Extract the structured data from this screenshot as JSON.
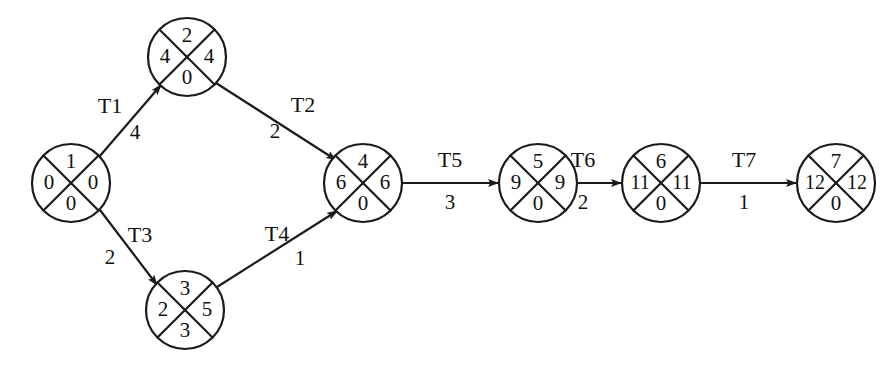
{
  "diagram": {
    "type": "pert-cpm-network",
    "title": "",
    "node_radius": 39,
    "node_cell_layout": {
      "top": "event-number",
      "left": "earliest-time",
      "right": "latest-time",
      "bottom": "slack"
    },
    "nodes": [
      {
        "id": "node-1",
        "cx": 71,
        "cy": 183,
        "top": "1",
        "left": "0",
        "right": "0",
        "bottom": "0"
      },
      {
        "id": "node-2",
        "cx": 187,
        "cy": 57,
        "top": "2",
        "left": "4",
        "right": "4",
        "bottom": "0"
      },
      {
        "id": "node-3",
        "cx": 185,
        "cy": 310,
        "top": "3",
        "left": "2",
        "right": "5",
        "bottom": "3"
      },
      {
        "id": "node-4",
        "cx": 363,
        "cy": 183,
        "top": "4",
        "left": "6",
        "right": "6",
        "bottom": "0"
      },
      {
        "id": "node-5",
        "cx": 538,
        "cy": 183,
        "top": "5",
        "left": "9",
        "right": "9",
        "bottom": "0"
      },
      {
        "id": "node-6",
        "cx": 661,
        "cy": 183,
        "top": "6",
        "left": "11",
        "right": "11",
        "bottom": "0"
      },
      {
        "id": "node-7",
        "cx": 836,
        "cy": 183,
        "top": "7",
        "left": "12",
        "right": "12",
        "bottom": "0"
      }
    ],
    "edges": [
      {
        "id": "edge-t1",
        "label": "T1",
        "duration": "4",
        "from": "node-1",
        "to": "node-2",
        "x1": 99,
        "y1": 157,
        "x2": 161,
        "y2": 85,
        "label_x": 110,
        "label_y": 108,
        "dur_x": 135,
        "dur_y": 134
      },
      {
        "id": "edge-t2",
        "label": "T2",
        "duration": "2",
        "from": "node-2",
        "to": "node-4",
        "x1": 216,
        "y1": 83,
        "x2": 336,
        "y2": 160,
        "label_x": 303,
        "label_y": 107,
        "dur_x": 275,
        "dur_y": 133
      },
      {
        "id": "edge-t3",
        "label": "T3",
        "duration": "2",
        "from": "node-1",
        "to": "node-3",
        "x1": 100,
        "y1": 210,
        "x2": 157,
        "y2": 285,
        "label_x": 140,
        "label_y": 237,
        "dur_x": 110,
        "dur_y": 259
      },
      {
        "id": "edge-t4",
        "label": "T4",
        "duration": "1",
        "from": "node-3",
        "to": "node-4",
        "x1": 217,
        "y1": 287,
        "x2": 337,
        "y2": 211,
        "label_x": 277,
        "label_y": 236,
        "dur_x": 300,
        "dur_y": 260
      },
      {
        "id": "edge-t5",
        "label": "T5",
        "duration": "3",
        "from": "node-4",
        "to": "node-5",
        "x1": 402,
        "y1": 183,
        "x2": 498,
        "y2": 183,
        "label_x": 450,
        "label_y": 162,
        "dur_x": 450,
        "dur_y": 204
      },
      {
        "id": "edge-t6",
        "label": "T6",
        "duration": "2",
        "from": "node-5",
        "to": "node-6",
        "x1": 577,
        "y1": 183,
        "x2": 621,
        "y2": 183,
        "label_x": 583,
        "label_y": 162,
        "dur_x": 583,
        "dur_y": 204
      },
      {
        "id": "edge-t7",
        "label": "T7",
        "duration": "1",
        "from": "node-6",
        "to": "node-7",
        "x1": 700,
        "y1": 183,
        "x2": 796,
        "y2": 183,
        "label_x": 744,
        "label_y": 162,
        "dur_x": 744,
        "dur_y": 204
      }
    ],
    "colors": {
      "stroke": "#1a1a1a",
      "text": "#111111",
      "background": "#ffffff"
    }
  }
}
